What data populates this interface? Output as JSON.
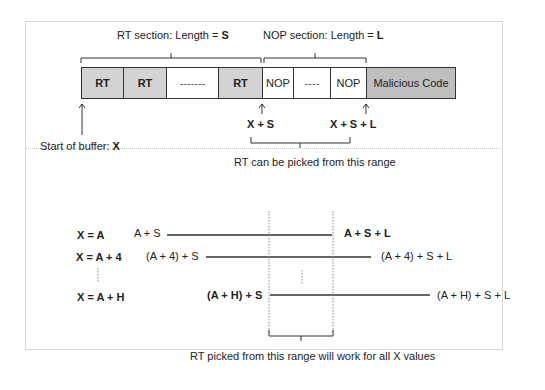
{
  "top": {
    "rt_section_label": "RT section: Length = ",
    "rt_section_var": "S",
    "nop_section_label": "NOP section: Length = ",
    "nop_section_var": "L",
    "cells": [
      {
        "label": "RT",
        "type": "rt"
      },
      {
        "label": "RT",
        "type": "rt"
      },
      {
        "label": "-------",
        "type": "dash"
      },
      {
        "label": "RT",
        "type": "rt"
      },
      {
        "label": "NOP",
        "type": "nop"
      },
      {
        "label": "----",
        "type": "dash"
      },
      {
        "label": "NOP",
        "type": "nop"
      },
      {
        "label": "Malicious Code",
        "type": "code"
      }
    ],
    "start_label": "Start of buffer: ",
    "start_var": "X",
    "x_plus_s": "X + S",
    "x_plus_s_plus_l": "X + S + L",
    "range_label": "RT can be picked from this range"
  },
  "bottom": {
    "rows": [
      {
        "x_label": "X = A",
        "start": "A + S",
        "end": "A + S + L",
        "start_bold": false,
        "end_bold": true
      },
      {
        "x_label": "X = A + 4",
        "start": "(A + 4) + S",
        "end": "(A + 4) + S + L",
        "start_bold": false,
        "end_bold": false
      },
      {
        "x_label": "X = A + H",
        "start": "(A + H) + S",
        "end": "(A + H) + S + L",
        "start_bold": true,
        "end_bold": false
      }
    ],
    "range_label": "RT picked from this range will work for all X values"
  },
  "colors": {
    "rt_fill": "#d3d3d3",
    "code_fill": "#bfbfbf",
    "line": "#333333",
    "frame": "#d8d8d8"
  }
}
